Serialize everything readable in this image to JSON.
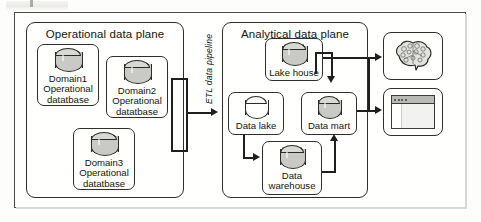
{
  "diagram": {
    "operational_plane": {
      "title": "Operational data plane",
      "nodes": [
        {
          "id": "domain1",
          "label": "Domain1\nOperational\ndatatbase",
          "cylinder": "filled"
        },
        {
          "id": "domain2",
          "label": "Domain2\nOperational\ndatatbase",
          "cylinder": "filled"
        },
        {
          "id": "domain3",
          "label": "Domain3\nOperational\ndatatbase",
          "cylinder": "filled"
        }
      ]
    },
    "pipeline": {
      "label": "ETL data pipeline"
    },
    "analytical_plane": {
      "title": "Analytical data plane",
      "nodes": [
        {
          "id": "lakehouse",
          "label": "Lake house",
          "cylinder": "filled"
        },
        {
          "id": "datalake",
          "label": "Data lake",
          "cylinder": "hollow"
        },
        {
          "id": "datamart",
          "label": "Data mart",
          "cylinder": "filled"
        },
        {
          "id": "datawarehouse",
          "label": "Data\nwarehouse",
          "cylinder": "filled"
        }
      ]
    },
    "consumers": [
      {
        "id": "ml",
        "icon": "brain-icon"
      },
      {
        "id": "bi",
        "icon": "dashboard-window-icon"
      }
    ],
    "colors": {
      "line": "#1f1f1d",
      "cylinder_fill": "#c9c9c6",
      "frame": "#4a4a48",
      "background": "#fdfdfc"
    }
  }
}
